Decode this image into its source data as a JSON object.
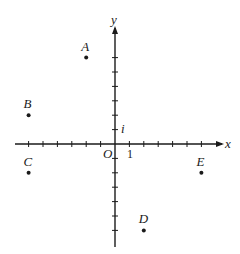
{
  "diagram": {
    "type": "complex-plane",
    "axes": {
      "x_label": "x",
      "y_label": "y",
      "origin_label": "O",
      "x_unit_label": "1",
      "y_unit_label": "i",
      "x_range": [
        -7,
        7
      ],
      "y_range": [
        -7,
        7
      ],
      "tick_count_each_side": 6
    },
    "points": [
      {
        "label": "A",
        "re": -2,
        "im": 6
      },
      {
        "label": "B",
        "re": -6,
        "im": 2
      },
      {
        "label": "C",
        "re": -6,
        "im": -2
      },
      {
        "label": "D",
        "re": 2,
        "im": -6
      },
      {
        "label": "E",
        "re": 6,
        "im": -2
      }
    ],
    "colors": {
      "ink": "#1a1a1a",
      "background": "#ffffff"
    }
  }
}
